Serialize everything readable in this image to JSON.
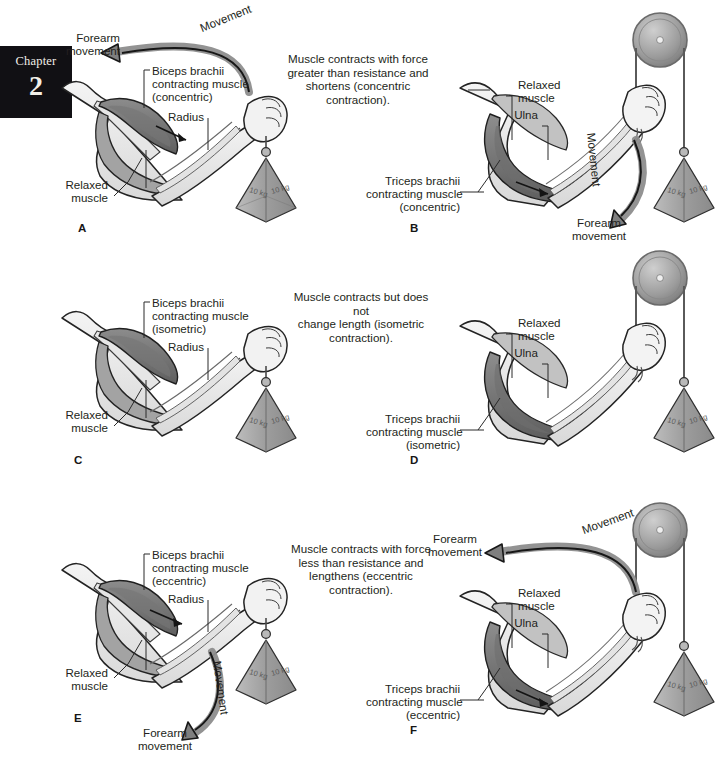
{
  "page": {
    "background": "#ffffff",
    "width": 717,
    "height": 768,
    "figure_title": "Types of muscle contraction"
  },
  "chapter_tab": {
    "word": "Chapter",
    "number": "2",
    "background": "#111014",
    "text_color": "#f2efe9"
  },
  "common": {
    "weight_label": "10 kg",
    "weight_label_2": "10 kg",
    "movement_word": "Movement",
    "forearm_movement": "Forearm\nmovement",
    "relaxed_muscle": "Relaxed\nmuscle",
    "radius": "Radius",
    "ulna": "Ulna",
    "colors": {
      "ink": "#231f20",
      "muscle_dark": "#6f6f6f",
      "muscle_mid": "#9a9a9a",
      "muscle_light": "#c9c9c9",
      "bone": "#dedede",
      "skin": "#efefef",
      "arrow": "#1a1a1a",
      "arrow_fill": "#8d8d8d",
      "weight": "#a9a9a9",
      "pulley": "#9d9d9d"
    }
  },
  "rows": [
    {
      "id": "row-concentric",
      "center_text": "Muscle contracts with force\ngreater than resistance and\nshortens (concentric\ncontraction).",
      "left": {
        "letter": "A",
        "muscle_label": "Biceps brachii\ncontracting muscle\n(concentric)",
        "bone_label": "Radius",
        "relaxed_label": "Relaxed\nmuscle",
        "movement_word": "Movement",
        "forearm_movement": "Forearm\nmovement",
        "has_movement_arrow": true,
        "weight": "10 kg"
      },
      "right": {
        "letter": "B",
        "muscle_label": "Triceps brachii\ncontracting muscle\n(concentric)",
        "bone_label": "Ulna",
        "relaxed_label": "Relaxed\nmuscle",
        "movement_word": "Movement",
        "forearm_movement": "Forearm\nmovement",
        "has_movement_arrow": true,
        "weight": "10 kg",
        "weight2": "10 kg"
      }
    },
    {
      "id": "row-isometric",
      "center_text": "Muscle contracts but does not\nchange length (isometric\ncontraction).",
      "left": {
        "letter": "C",
        "muscle_label": "Biceps brachii\ncontracting muscle\n(isometric)",
        "bone_label": "Radius",
        "relaxed_label": "Relaxed\nmuscle",
        "movement_word": "",
        "forearm_movement": "",
        "has_movement_arrow": false,
        "weight": "10 kg"
      },
      "right": {
        "letter": "D",
        "muscle_label": "Triceps brachii\ncontracting muscle\n(isometric)",
        "bone_label": "Ulna",
        "relaxed_label": "Relaxed\nmuscle",
        "movement_word": "",
        "forearm_movement": "",
        "has_movement_arrow": false,
        "weight": "10 kg",
        "weight2": "10 kg"
      }
    },
    {
      "id": "row-eccentric",
      "center_text": "Muscle contracts with force\nless than resistance and\nlengthens (eccentric\ncontraction).",
      "left": {
        "letter": "E",
        "muscle_label": "Biceps brachii\ncontracting muscle\n(eccentric)",
        "bone_label": "Radius",
        "relaxed_label": "Relaxed\nmuscle",
        "movement_word": "Movement",
        "forearm_movement": "Forearm\nmovement",
        "has_movement_arrow": true,
        "weight": "10 kg"
      },
      "right": {
        "letter": "F",
        "muscle_label": "Triceps brachii\ncontracting muscle\n(eccentric)",
        "bone_label": "Ulna",
        "relaxed_label": "Relaxed\nmuscle",
        "movement_word": "Movement",
        "forearm_movement": "Forearm\nmovement",
        "has_movement_arrow": true,
        "weight": "10 kg",
        "weight2": "10 kg"
      }
    }
  ]
}
